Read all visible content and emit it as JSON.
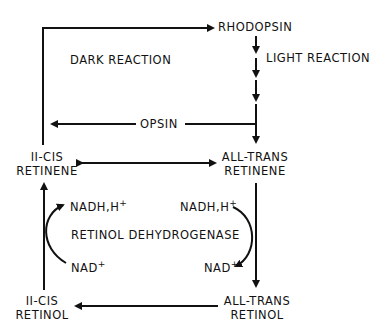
{
  "diagram": {
    "nodes": {
      "rhodopsin": "RHODOPSIN",
      "opsin": "OPSIN",
      "cis_retinene": [
        "II-CIS",
        "RETINENE"
      ],
      "trans_retinene": [
        "ALL-TRANS",
        "RETINENE"
      ],
      "cis_retinol": [
        "II-CIS",
        "RETINOL"
      ],
      "trans_retinol": [
        "ALL-TRANS",
        "RETINOL"
      ]
    },
    "labels": {
      "dark_reaction": "DARK REACTION",
      "light_reaction": "LIGHT REACTION",
      "enzyme": "RETINOL DEHYDROGENASE",
      "nadh_left": "NADH,H",
      "nadh_right": "NADH,H",
      "nad_left": "NAD",
      "nad_right": "NAD",
      "plus": "+"
    },
    "colors": {
      "line": "#111111",
      "background": "#ffffff"
    }
  }
}
